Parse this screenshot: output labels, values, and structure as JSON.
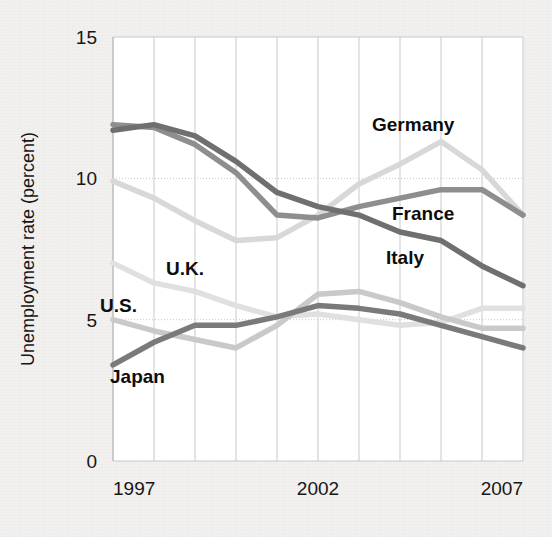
{
  "chart_data": {
    "type": "line",
    "title": "",
    "xlabel": "",
    "ylabel": "Unemployment rate (percent)",
    "ylim": [
      0,
      15
    ],
    "yticks": [
      0,
      5,
      10,
      15
    ],
    "ytick_labels": [
      "0",
      "5",
      "10",
      "15"
    ],
    "xlim": [
      1997,
      2007
    ],
    "xticks": [
      1997,
      2002,
      2007
    ],
    "xtick_labels": [
      "1997",
      "2002",
      "2007"
    ],
    "grid": "both-light-dotted",
    "legend_position": "inline-annotations",
    "x": [
      1997,
      1998,
      1999,
      2000,
      2001,
      2002,
      2003,
      2004,
      2005,
      2006,
      2007
    ],
    "series": [
      {
        "name": "Germany",
        "color": "#d8d8d8",
        "values": [
          9.9,
          9.3,
          8.5,
          7.8,
          7.9,
          8.7,
          9.8,
          10.5,
          11.3,
          10.3,
          8.7
        ]
      },
      {
        "name": "France",
        "color": "#8e8e8e",
        "values": [
          11.9,
          11.8,
          11.2,
          10.2,
          8.7,
          8.6,
          9.0,
          9.3,
          9.6,
          9.6,
          8.7
        ]
      },
      {
        "name": "Italy",
        "color": "#6f6f6f",
        "values": [
          11.7,
          11.9,
          11.5,
          10.6,
          9.5,
          9.0,
          8.7,
          8.1,
          7.8,
          6.9,
          6.2
        ]
      },
      {
        "name": "U.K.",
        "color": "#e0e0e0",
        "values": [
          7.0,
          6.3,
          6.0,
          5.5,
          5.1,
          5.2,
          5.0,
          4.8,
          4.9,
          5.4,
          5.4
        ]
      },
      {
        "name": "U.S.",
        "color": "#c9c9c9",
        "values": [
          5.0,
          4.6,
          4.3,
          4.0,
          4.8,
          5.9,
          6.0,
          5.6,
          5.1,
          4.7,
          4.7
        ]
      },
      {
        "name": "Japan",
        "color": "#7a7a7a",
        "values": [
          3.4,
          4.2,
          4.8,
          4.8,
          5.1,
          5.5,
          5.4,
          5.2,
          4.8,
          4.4,
          4.0
        ]
      }
    ],
    "annotations": [
      {
        "text": "Germany",
        "x_px": 372,
        "y_px": 131
      },
      {
        "text": "France",
        "x_px": 392,
        "y_px": 220
      },
      {
        "text": "Italy",
        "x_px": 386,
        "y_px": 264
      },
      {
        "text": "U.K.",
        "x_px": 166,
        "y_px": 275
      },
      {
        "text": "U.S.",
        "x_px": 100,
        "y_px": 312
      },
      {
        "text": "Japan",
        "x_px": 110,
        "y_px": 383
      }
    ]
  },
  "axis": {
    "y_title": "Unemployment rate (percent)",
    "y_tick_0": "0",
    "y_tick_5": "5",
    "y_tick_10": "10",
    "y_tick_15": "15",
    "x_tick_start": "1997",
    "x_tick_mid": "2002",
    "x_tick_end": "2007"
  },
  "labels": {
    "germany": "Germany",
    "france": "France",
    "italy": "Italy",
    "uk": "U.K.",
    "us": "U.S.",
    "japan": "Japan"
  },
  "colors": {
    "background": "#f2f1ef",
    "plot_background": "#ffffff",
    "grid": "#c9c9c9",
    "axis_text": "#161616"
  }
}
